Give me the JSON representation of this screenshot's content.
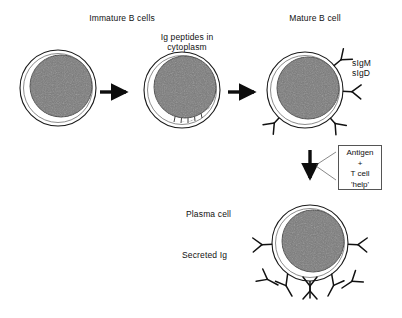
{
  "figure": {
    "title_immature": "Immature B cells",
    "title_mature": "Mature B cell",
    "label_ig_peptides": "Ig peptides in\ncytoplasm",
    "label_surface_ig": "sIgM\nsIgD",
    "label_plasma_cell": "Plasma cell",
    "label_secreted_ig": "Secreted Ig",
    "antigen_box": {
      "line1": "Antigen",
      "line2": "+",
      "line3": "T cell",
      "line4": "'help'"
    },
    "colors": {
      "background": "#ffffff",
      "nucleus": "#7a7a7a",
      "nucleus_edge": "#3a3a3a",
      "cytoplasm": "#ffffff",
      "membrane": "#1a1a1a",
      "ink": "#111111",
      "box_border": "#555555"
    },
    "cells": [
      {
        "name": "immature-b-cell-1",
        "stage": "immature",
        "cx": 58,
        "cy": 88,
        "r": 38,
        "nucleus_cx": 61,
        "nucleus_cy": 86,
        "nucleus_r": 31,
        "receptors": 0,
        "hatching": false
      },
      {
        "name": "immature-b-cell-2",
        "stage": "immature-ig-peptides",
        "cx": 182,
        "cy": 90,
        "r": 38,
        "nucleus_cx": 185,
        "nucleus_cy": 87,
        "nucleus_r": 31,
        "receptors": 0,
        "hatching": true
      },
      {
        "name": "mature-b-cell",
        "stage": "mature",
        "cx": 305,
        "cy": 90,
        "r": 38,
        "nucleus_cx": 308,
        "nucleus_cy": 88,
        "nucleus_r": 31,
        "receptors": 4,
        "hatching": false
      },
      {
        "name": "plasma-cell",
        "stage": "plasma",
        "cx": 310,
        "cy": 243,
        "r": 38,
        "nucleus_cx": 313,
        "nucleus_cy": 241,
        "nucleus_r": 31,
        "receptors": 2,
        "hatching": false
      }
    ],
    "receptor_angles": {
      "mature": [
        38,
        0,
        -42,
        -138
      ],
      "plasma": [
        2,
        178
      ]
    },
    "secreted_ig_count": 5,
    "arrows": [
      {
        "name": "arrow-stage-1-to-2",
        "direction": "right",
        "x1": 100,
        "y1": 92,
        "x2": 130,
        "y2": 92
      },
      {
        "name": "arrow-stage-2-to-3",
        "direction": "right",
        "x1": 228,
        "y1": 92,
        "x2": 258,
        "y2": 92
      },
      {
        "name": "arrow-activation",
        "direction": "down",
        "x1": 310,
        "y1": 150,
        "x2": 310,
        "y2": 182
      }
    ]
  }
}
